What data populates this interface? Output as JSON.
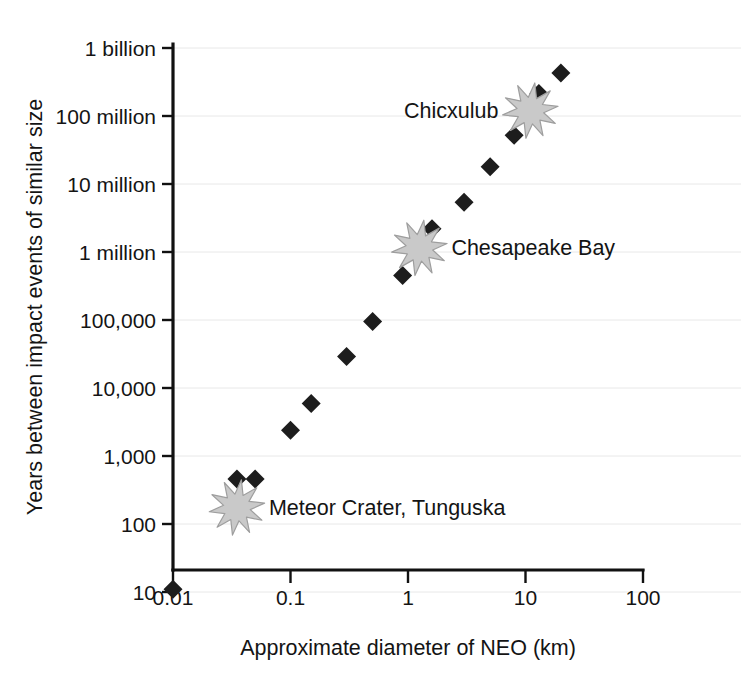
{
  "chart_data": {
    "type": "scatter",
    "title": "",
    "xlabel": "Approximate diameter of NEO (km)",
    "ylabel": "Years between impact events of similar size",
    "xscale": "log",
    "yscale": "log",
    "xlim": [
      0.01,
      100
    ],
    "ylim": [
      10,
      1000000000
    ],
    "grid": true,
    "legend": false,
    "xtick_labels": [
      "0.01",
      "0.1",
      "1",
      "10",
      "100"
    ],
    "xtick_values": [
      0.01,
      0.1,
      1,
      10,
      100
    ],
    "ytick_labels": [
      "10",
      "100",
      "1,000",
      "10,000",
      "100,000",
      "1 million",
      "10 million",
      "100 million",
      "1 billion"
    ],
    "ytick_values": [
      10,
      100,
      1000,
      10000,
      100000,
      1000000,
      10000000,
      100000000,
      1000000000
    ],
    "series": [
      {
        "name": "Impact events",
        "marker": "diamond",
        "color": "#1d1d1d",
        "points": [
          {
            "x": 0.01,
            "y": 11
          },
          {
            "x": 0.035,
            "y": 460
          },
          {
            "x": 0.05,
            "y": 460
          },
          {
            "x": 0.1,
            "y": 2400
          },
          {
            "x": 0.15,
            "y": 5900
          },
          {
            "x": 0.3,
            "y": 29000
          },
          {
            "x": 0.5,
            "y": 95000
          },
          {
            "x": 0.9,
            "y": 450000
          },
          {
            "x": 1.2,
            "y": 1050000
          },
          {
            "x": 1.6,
            "y": 2200000
          },
          {
            "x": 3.0,
            "y": 5400000
          },
          {
            "x": 5.0,
            "y": 18000000
          },
          {
            "x": 8.0,
            "y": 52000000
          },
          {
            "x": 10.0,
            "y": 110000000
          },
          {
            "x": 13.0,
            "y": 215000000
          },
          {
            "x": 20.0,
            "y": 430000000
          }
        ]
      }
    ],
    "annotations": [
      {
        "label": "Meteor Crater, Tunguska",
        "x": 0.035,
        "y": 175,
        "marker": "starburst",
        "marker_color": "#c9c9c9",
        "label_side": "right"
      },
      {
        "label": "Chesapeake Bay",
        "x": 1.25,
        "y": 1150000,
        "marker": "starburst",
        "marker_color": "#c9c9c9",
        "label_side": "right"
      },
      {
        "label": "Chicxulub",
        "x": 11.0,
        "y": 120000000,
        "marker": "starburst",
        "marker_color": "#c9c9c9",
        "label_side": "left"
      }
    ]
  },
  "axes": {
    "x_title": "Approximate diameter of NEO (km)",
    "y_title": "Years between impact events of similar size",
    "x_ticks": [
      "0.01",
      "0.1",
      "1",
      "10",
      "100"
    ],
    "y_ticks": [
      "1 billion",
      "100 million",
      "10 million",
      "1 million",
      "100,000",
      "10,000",
      "1,000",
      "100",
      "10"
    ]
  },
  "annotation_labels": {
    "meteor_crater": "Meteor Crater, Tunguska",
    "chesapeake": "Chesapeake Bay",
    "chicxulub": "Chicxulub"
  },
  "colors": {
    "marker": "#1d1d1d",
    "star_fill": "#c9c9c9",
    "star_stroke": "#9e9e9e",
    "axis": "#111111",
    "grid": "#e8e8e8",
    "text": "#141414",
    "background": "#ffffff"
  }
}
